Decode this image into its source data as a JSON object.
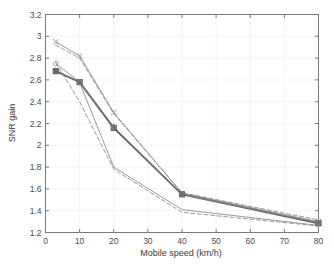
{
  "figure": {
    "background_color": "#ffffff",
    "axes_color": "#7a7a7a",
    "grid_color": "#f0f0f0",
    "line_color": "#8c8c8c",
    "bold_line_color": "#5a5a5a",
    "marker_fill": "#6b6b6b"
  },
  "chart_data": {
    "type": "line",
    "title": "",
    "xlabel": "Mobile speed (km/h)",
    "ylabel": "SNR gain",
    "xlim": [
      0,
      80
    ],
    "ylim": [
      1.2,
      3.2
    ],
    "xticks": [
      0,
      10,
      20,
      30,
      40,
      50,
      60,
      70,
      80
    ],
    "xtick_labels": [
      "0",
      "10",
      "20",
      "30",
      "40",
      "50",
      "60",
      "70",
      "80"
    ],
    "yticks": [
      1.2,
      1.4,
      1.6,
      1.8,
      2.0,
      2.2,
      2.4,
      2.6,
      2.8,
      3.0,
      3.2
    ],
    "ytick_labels": [
      "1.2",
      "1.4",
      "1.6",
      "1.8",
      "2",
      "2.2",
      "2.4",
      "2.6",
      "2.8",
      "3",
      "3.2"
    ],
    "grid": true,
    "legend": "none",
    "x": [
      3,
      10,
      20,
      40,
      80
    ],
    "series": [
      {
        "name": "upper-solid-x",
        "style": "solid",
        "marker": "x",
        "width": 0.9,
        "values": [
          2.95,
          2.82,
          2.3,
          1.56,
          1.3
        ]
      },
      {
        "name": "mean-bold-square",
        "style": "solid",
        "marker": "square",
        "width": 1.9,
        "values": [
          2.68,
          2.58,
          2.16,
          1.55,
          1.285
        ]
      },
      {
        "name": "middle-solid-diamond",
        "style": "solid",
        "marker": "diamond",
        "width": 0.9,
        "values": [
          2.75,
          2.58,
          2.17,
          1.55,
          1.29
        ]
      },
      {
        "name": "lower-solid",
        "style": "solid",
        "marker": "none",
        "width": 0.9,
        "values": [
          2.69,
          2.575,
          1.8,
          1.41,
          1.265
        ]
      },
      {
        "name": "upper-dashed-ci",
        "style": "dashed",
        "marker": "none",
        "width": 0.9,
        "values": [
          2.92,
          2.8,
          2.29,
          1.565,
          1.315
        ]
      },
      {
        "name": "lower-dashed-ci",
        "style": "dashed",
        "marker": "none",
        "width": 0.9,
        "values": [
          2.76,
          2.4,
          1.78,
          1.385,
          1.26
        ]
      }
    ]
  }
}
